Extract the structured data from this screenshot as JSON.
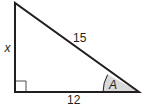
{
  "diagram": {
    "type": "right-triangle",
    "labels": {
      "vertical_leg": "x",
      "hypotenuse": "15",
      "base": "12",
      "angle": "A"
    },
    "colors": {
      "stroke": "#231f20",
      "angle_fill": "#d9d9d9",
      "right_angle_marker": "#231f20"
    }
  }
}
